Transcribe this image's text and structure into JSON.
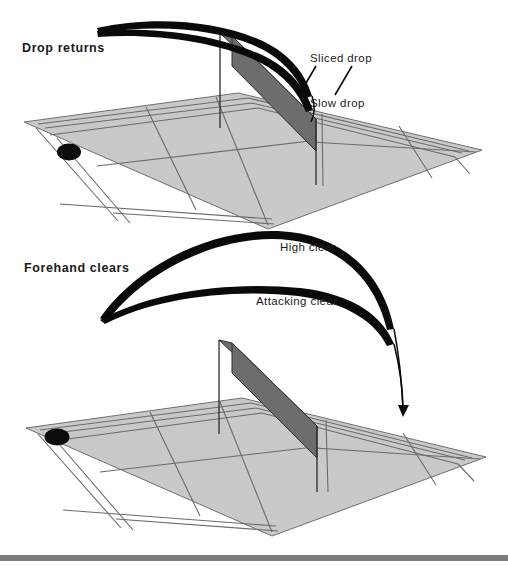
{
  "figure": {
    "background_color": "#ffffff",
    "court_surface_color": "#c9c9c9",
    "court_line_color": "#6b6b6b",
    "net_color": "#6d6d6d",
    "trajectory_color": "#0a0a0a",
    "footer_bar_color": "#7b7b7b"
  },
  "panels": [
    {
      "id": "drop-returns",
      "title": "Drop returns",
      "labels": [
        {
          "id": "sliced-drop",
          "text": "Sliced drop"
        },
        {
          "id": "slow-drop",
          "text": "Slow drop"
        }
      ]
    },
    {
      "id": "forehand-clears",
      "title": "Forehand clears",
      "labels": [
        {
          "id": "high-clear",
          "text": "High clear"
        },
        {
          "id": "attacking-clear",
          "text": "Attacking clear"
        }
      ]
    }
  ]
}
